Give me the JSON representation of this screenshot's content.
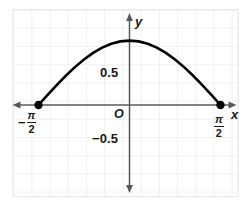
{
  "figure": {
    "title": "",
    "background": "#ffffff",
    "grid_color": "#e2e2e6",
    "axis_color": "#58585c",
    "curve_color": "#000000",
    "border_color": "#e8e8ec"
  },
  "labels": {
    "y_axis": "y",
    "x_axis": "x",
    "origin": "O",
    "y_tick_positive": "0.5",
    "y_tick_negative": "−0.5",
    "x_left_minus": "−",
    "pi_numerator": "π",
    "two_denominator": "2"
  },
  "chart_data": {
    "type": "line",
    "title": "",
    "xlabel": "x",
    "ylabel": "y",
    "grid": true,
    "legend": null,
    "function": "y = cos(x)",
    "xlim": [
      -1.8325,
      1.8325
    ],
    "ylim": [
      -1.5,
      1.75
    ],
    "xticks": [
      -1.5708,
      1.5708
    ],
    "xtick_labels": [
      "−π/2",
      "π/2"
    ],
    "yticks": [
      -0.5,
      0.5
    ],
    "ytick_labels": [
      "−0.5",
      "0.5"
    ],
    "domain": [
      -1.5708,
      1.5708
    ],
    "endpoints": [
      {
        "x": -1.5708,
        "y": 0,
        "marker": "filled-circle"
      },
      {
        "x": 1.5708,
        "y": 0,
        "marker": "filled-circle"
      }
    ],
    "maximum": {
      "x": 0,
      "y": 1
    },
    "x": [
      -1.5708,
      -1.4137,
      -1.2566,
      -1.0996,
      -0.9425,
      -0.7854,
      -0.6283,
      -0.4712,
      -0.3142,
      -0.1571,
      0,
      0.1571,
      0.3142,
      0.4712,
      0.6283,
      0.7854,
      0.9425,
      1.0996,
      1.2566,
      1.4137,
      1.5708
    ],
    "values": [
      0,
      0.156,
      0.309,
      0.454,
      0.588,
      0.707,
      0.809,
      0.891,
      0.951,
      0.988,
      1,
      0.988,
      0.951,
      0.891,
      0.809,
      0.707,
      0.588,
      0.454,
      0.309,
      0.156,
      0
    ]
  }
}
